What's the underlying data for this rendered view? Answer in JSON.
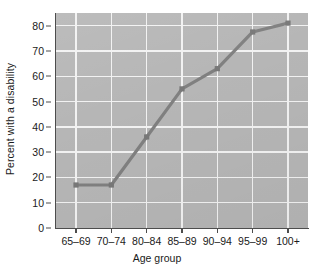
{
  "chart_data": {
    "type": "line",
    "title": "",
    "subtitle": "",
    "xlabel": "Age group",
    "ylabel": "Percent with a disability",
    "categories": [
      "65–69",
      "70–74",
      "80–84",
      "85–89",
      "90–94",
      "95–99",
      "100+"
    ],
    "values": [
      17,
      17,
      36,
      55,
      63,
      77.5,
      81
    ],
    "series": [
      {
        "name": "Percent with a disability",
        "values": [
          17,
          17,
          36,
          55,
          63,
          77.5,
          81
        ]
      }
    ],
    "ylim": [
      0,
      85
    ],
    "yticks": [
      0,
      10,
      20,
      30,
      40,
      50,
      60,
      70,
      80
    ],
    "ytick_labels": [
      "0",
      "10",
      "20",
      "30",
      "40",
      "50",
      "60",
      "70",
      "80"
    ],
    "xtick_labels": [
      "65–69",
      "70–74",
      "80–84",
      "85–89",
      "90–94",
      "95–99",
      "100+"
    ],
    "grid": true,
    "grid_axis": "both",
    "legend": false,
    "legend_position": "none",
    "marker": "square",
    "annotations": []
  },
  "style": {
    "page_background": "#ffffff",
    "plot_background": "#b6b6b6",
    "gridline_color": "#f2f2f2",
    "line_color": "#808080",
    "marker_color": "#787878",
    "axis_color": "#4d4d4d",
    "text_color": "#1a1a1a"
  }
}
